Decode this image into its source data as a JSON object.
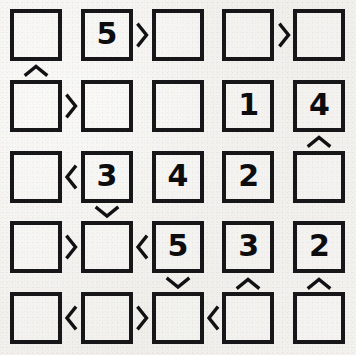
{
  "puzzle": {
    "type": "futoshiki",
    "rows": 5,
    "cols": 5,
    "background_color": "#f2f1ee",
    "ink_color": "#17171a",
    "grid": [
      [
        "",
        "5",
        "",
        "",
        ""
      ],
      [
        "",
        "",
        "",
        "1",
        "4"
      ],
      [
        "",
        "3",
        "4",
        "2",
        ""
      ],
      [
        "",
        "",
        "5",
        "3",
        "2"
      ],
      [
        "",
        "",
        "",
        "",
        ""
      ]
    ],
    "horizontal_constraints": [
      [
        "",
        ">",
        "",
        ">"
      ],
      [
        ">",
        "",
        "",
        ""
      ],
      [
        "<",
        "",
        "",
        ""
      ],
      [
        ">",
        "<",
        "",
        ""
      ],
      [
        "<",
        ">",
        "<",
        ""
      ]
    ],
    "vertical_constraints": [
      [
        "^",
        "",
        "",
        "",
        ""
      ],
      [
        "",
        "",
        "",
        "",
        "^"
      ],
      [
        "",
        "v",
        "",
        "",
        ""
      ],
      [
        "",
        "",
        "v",
        "^",
        "^"
      ]
    ]
  }
}
